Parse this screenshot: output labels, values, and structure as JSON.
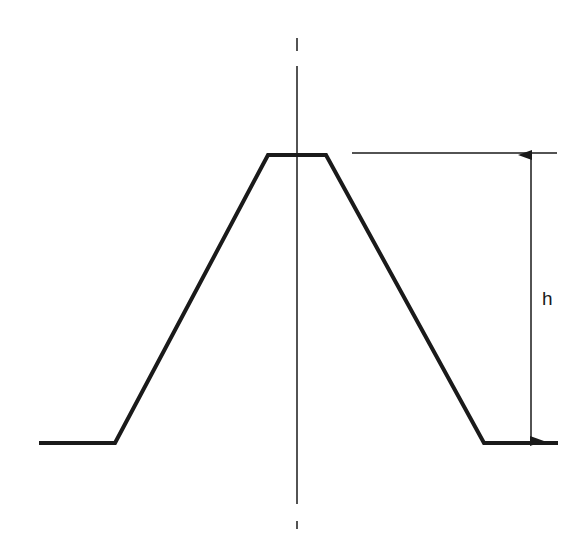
{
  "diagram": {
    "type": "trapezoidal-profile",
    "labels": {
      "height": "h"
    },
    "profile_points": [
      [
        39,
        443
      ],
      [
        115,
        443
      ],
      [
        268,
        155
      ],
      [
        326,
        155
      ],
      [
        484,
        443
      ],
      [
        558,
        443
      ]
    ],
    "centerline": {
      "x": 297,
      "dash_top": [
        38,
        51
      ],
      "solid": [
        66,
        504
      ],
      "dash_bottom": [
        521,
        529
      ]
    },
    "reference_line": {
      "y": 153,
      "x1": 352,
      "x2": 557
    },
    "dimension": {
      "x": 531,
      "y_top": 153,
      "y_bottom": 443
    },
    "colors": {
      "stroke": "#1a1a1a",
      "background": "#ffffff"
    }
  }
}
